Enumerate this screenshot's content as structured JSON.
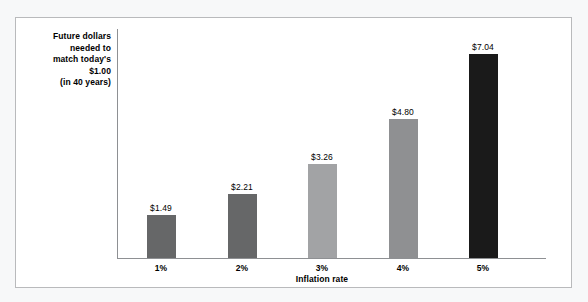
{
  "chart_data": {
    "type": "bar",
    "title": "",
    "xlabel": "Inflation rate",
    "ylabel": "Future dollars needed to match today's $1.00 (in 40 years)",
    "ylabel_lines": [
      "Future dollars",
      "needed to",
      "match today's",
      "$1.00",
      "(in 40 years)"
    ],
    "categories": [
      "1%",
      "2%",
      "3%",
      "4%",
      "5%"
    ],
    "values": [
      1.49,
      2.21,
      3.26,
      4.8,
      7.04
    ],
    "value_labels": [
      "$1.49",
      "$2.21",
      "$3.26",
      "$4.80",
      "$7.04"
    ],
    "bar_colors": [
      "#666768",
      "#666768",
      "#a2a3a5",
      "#8f9092",
      "#1a1a1a"
    ],
    "ylim": [
      0,
      7.9
    ],
    "grid": false,
    "legend": null
  },
  "colors": {
    "page_background": "#f7f8f9",
    "panel_background": "#ffffff",
    "panel_border": "#b9babc",
    "axis_line": "#8e9093",
    "text": "#000000"
  }
}
